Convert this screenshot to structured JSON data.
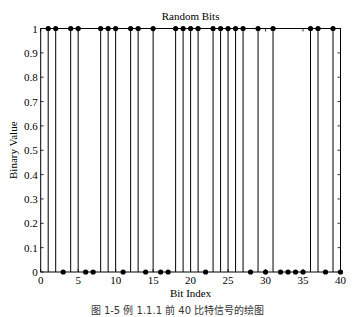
{
  "chart_data": {
    "type": "stem",
    "title": "Random Bits",
    "xlabel": "Bit Index",
    "ylabel": "Binary Value",
    "xlim": [
      0,
      40
    ],
    "ylim": [
      0,
      1
    ],
    "xticks": [
      0,
      5,
      10,
      15,
      20,
      25,
      30,
      35,
      40
    ],
    "xtick_labels": [
      "0",
      "5",
      "10",
      "15",
      "20",
      "25",
      "30",
      "35",
      "40"
    ],
    "yticks": [
      0,
      0.1,
      0.2,
      0.3,
      0.4,
      0.5,
      0.6,
      0.7,
      0.8,
      0.9,
      1
    ],
    "ytick_labels": [
      "0",
      "0.1",
      "0.2",
      "0.3",
      "0.4",
      "0.5",
      "0.6",
      "0.7",
      "0.8",
      "0.9",
      "1"
    ],
    "grid": false,
    "x": [
      1,
      2,
      3,
      4,
      5,
      6,
      7,
      8,
      9,
      10,
      11,
      12,
      13,
      14,
      15,
      16,
      17,
      18,
      19,
      20,
      21,
      22,
      23,
      24,
      25,
      26,
      27,
      28,
      29,
      30,
      31,
      32,
      33,
      34,
      35,
      36,
      37,
      38,
      39,
      40
    ],
    "values": [
      1,
      1,
      0,
      1,
      1,
      0,
      0,
      1,
      1,
      1,
      0,
      1,
      1,
      0,
      1,
      0,
      0,
      1,
      1,
      1,
      1,
      0,
      1,
      1,
      1,
      1,
      1,
      0,
      1,
      0,
      1,
      0,
      0,
      0,
      0,
      1,
      1,
      0,
      1,
      0
    ],
    "line_color": "#000000",
    "marker": "filled-circle"
  },
  "caption": "图 1-5  例 1.1.1 前 40 比特信号的绘图"
}
